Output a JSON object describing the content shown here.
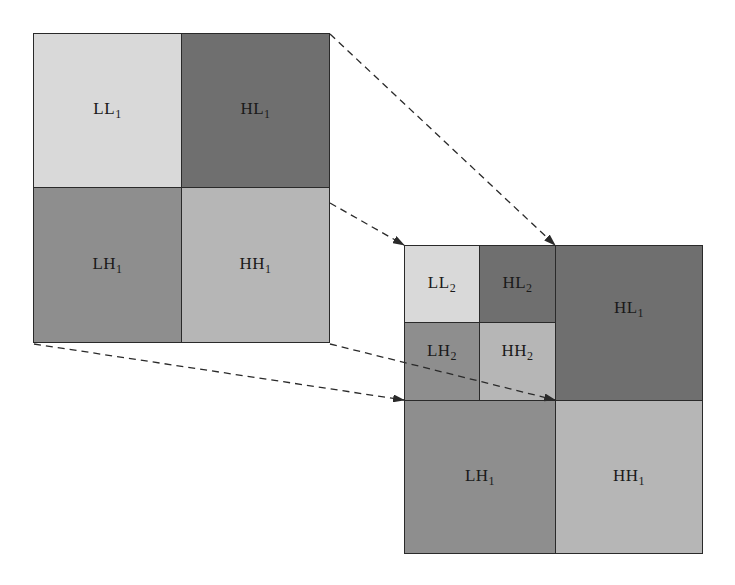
{
  "diagram": {
    "colors": {
      "LL": "#d9d9d9",
      "HL": "#6f6f6f",
      "LH": "#8e8e8e",
      "HH": "#b6b6b6",
      "border": "#2a2a2a",
      "arrow": "#2a2a2a"
    },
    "level1": {
      "LL": {
        "base": "LL",
        "sub": "1"
      },
      "HL": {
        "base": "HL",
        "sub": "1"
      },
      "LH": {
        "base": "LH",
        "sub": "1"
      },
      "HH": {
        "base": "HH",
        "sub": "1"
      }
    },
    "level2": {
      "LL": {
        "base": "LL",
        "sub": "2"
      },
      "HL": {
        "base": "HL",
        "sub": "2"
      },
      "LH": {
        "base": "LH",
        "sub": "2"
      },
      "HH": {
        "base": "HH",
        "sub": "2"
      },
      "HL1": {
        "base": "HL",
        "sub": "1"
      },
      "LH1": {
        "base": "LH",
        "sub": "1"
      },
      "HH1": {
        "base": "HH",
        "sub": "1"
      }
    },
    "arrows": [
      {
        "from": [
          329,
          33
        ],
        "to": [
          555,
          245
        ]
      },
      {
        "from": [
          329,
          202
        ],
        "to": [
          404,
          245
        ]
      },
      {
        "from": [
          33,
          343
        ],
        "to": [
          404,
          400
        ]
      },
      {
        "from": [
          329,
          343
        ],
        "to": [
          555,
          400
        ]
      }
    ]
  }
}
